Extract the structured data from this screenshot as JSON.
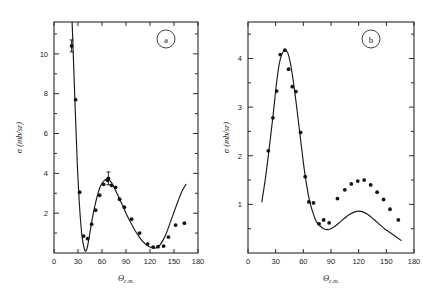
{
  "figure": {
    "background": "#ffffff",
    "curve_color": "#1a1a1a",
    "point_color": "#141414",
    "axis_color": "#2b2b2b"
  },
  "chart_data": [
    {
      "type": "scatter",
      "panel_label": "a",
      "title": "",
      "xlabel": "Θ",
      "xlabel_sub": "c.m.",
      "ylabel": "σ",
      "ylabel_unit": "(mb/sr)",
      "xlim": [
        0,
        180
      ],
      "ylim": [
        0,
        11.6
      ],
      "xticks": [
        0,
        30,
        60,
        90,
        120,
        150,
        180
      ],
      "xtick_labels": [
        "0",
        "30",
        "60",
        "90",
        "120",
        "150",
        "180"
      ],
      "yticks": [
        2,
        4,
        6,
        8,
        10
      ],
      "ytick_labels": [
        "2",
        "4",
        "6",
        "8",
        "10"
      ],
      "minor_yticks": [
        1,
        3,
        5,
        7,
        9,
        11
      ],
      "grid": false,
      "legend": false,
      "series": [
        {
          "name": "measured cross section",
          "kind": "points",
          "x": [
            22,
            27,
            32,
            37,
            42,
            47,
            52,
            57,
            62,
            67,
            68,
            72,
            77,
            82,
            88,
            97,
            107,
            117,
            124,
            130,
            137,
            143,
            152,
            163
          ],
          "y": [
            10.4,
            7.7,
            3.05,
            0.85,
            0.72,
            1.45,
            2.15,
            2.9,
            3.45,
            3.65,
            3.75,
            3.4,
            3.3,
            2.7,
            2.3,
            1.7,
            1.0,
            0.45,
            0.3,
            0.32,
            0.35,
            0.8,
            1.4,
            1.5
          ],
          "yerr": [
            0.3,
            0.0,
            0.0,
            0.0,
            0.0,
            0.0,
            0.0,
            0.0,
            0.0,
            0.0,
            0.32,
            0.0,
            0.0,
            0.0,
            0.0,
            0.0,
            0.0,
            0.0,
            0.0,
            0.0,
            0.0,
            0.0,
            0.0,
            0.0
          ]
        },
        {
          "name": "theoretical fit",
          "kind": "line",
          "x": [
            20,
            23,
            26,
            29,
            32,
            35,
            38,
            40,
            42,
            45,
            48,
            51,
            54,
            57,
            60,
            63,
            66,
            69,
            72,
            75,
            78,
            81,
            85,
            90,
            95,
            100,
            105,
            110,
            115,
            120,
            125,
            128,
            132,
            136,
            140,
            145,
            150,
            155,
            160,
            165
          ],
          "y": [
            14.2,
            11.2,
            7.8,
            4.6,
            2.3,
            0.85,
            0.2,
            0.1,
            0.35,
            1.05,
            1.75,
            2.35,
            2.85,
            3.25,
            3.5,
            3.65,
            3.72,
            3.68,
            3.52,
            3.3,
            3.05,
            2.8,
            2.45,
            2.0,
            1.6,
            1.22,
            0.9,
            0.62,
            0.42,
            0.3,
            0.25,
            0.26,
            0.38,
            0.62,
            0.95,
            1.5,
            2.05,
            2.6,
            3.1,
            3.45
          ]
        }
      ]
    },
    {
      "type": "scatter",
      "panel_label": "b",
      "title": "",
      "xlabel": "Θ",
      "xlabel_sub": "c.m.",
      "ylabel": "σ",
      "ylabel_unit": "(mb/sr)",
      "xlim": [
        0,
        180
      ],
      "ylim": [
        0,
        4.75
      ],
      "xticks": [
        0,
        30,
        60,
        90,
        120,
        150,
        180
      ],
      "xtick_labels": [
        "0",
        "30",
        "60",
        "90",
        "120",
        "150",
        "180"
      ],
      "yticks": [
        1,
        2,
        3,
        4
      ],
      "ytick_labels": [
        "1",
        "2",
        "3",
        "4"
      ],
      "minor_yticks": [
        0.5,
        1.5,
        2.5,
        3.5,
        4.5
      ],
      "grid": false,
      "legend": false,
      "series": [
        {
          "name": "measured cross section",
          "kind": "points",
          "x": [
            22,
            27,
            31,
            35,
            40,
            44,
            48,
            52,
            57,
            62,
            66,
            71,
            77,
            82,
            88,
            97,
            105,
            112,
            119,
            126,
            133,
            140,
            147,
            154,
            163
          ],
          "y": [
            2.1,
            2.78,
            3.33,
            4.08,
            4.17,
            3.78,
            3.42,
            3.32,
            2.48,
            1.57,
            1.05,
            1.03,
            0.6,
            0.68,
            0.62,
            1.12,
            1.3,
            1.42,
            1.48,
            1.5,
            1.4,
            1.25,
            1.1,
            0.9,
            0.68
          ],
          "yerr": [
            0,
            0,
            0,
            0,
            0,
            0,
            0,
            0,
            0,
            0,
            0,
            0,
            0,
            0,
            0,
            0,
            0,
            0,
            0,
            0,
            0,
            0,
            0,
            0,
            0
          ]
        },
        {
          "name": "theoretical fit",
          "kind": "line",
          "x": [
            15,
            19,
            23,
            27,
            31,
            34,
            37,
            40,
            43,
            46,
            49,
            52,
            55,
            58,
            61,
            64,
            67,
            70,
            74,
            78,
            82,
            86,
            90,
            95,
            100,
            105,
            110,
            115,
            120,
            125,
            130,
            136,
            142,
            148,
            154,
            160,
            166
          ],
          "y": [
            1.05,
            1.55,
            2.15,
            2.8,
            3.5,
            3.9,
            4.1,
            4.18,
            4.12,
            3.9,
            3.55,
            3.12,
            2.65,
            2.18,
            1.72,
            1.35,
            1.05,
            0.85,
            0.65,
            0.56,
            0.5,
            0.48,
            0.5,
            0.56,
            0.64,
            0.72,
            0.79,
            0.84,
            0.86,
            0.84,
            0.79,
            0.7,
            0.6,
            0.5,
            0.42,
            0.34,
            0.26
          ]
        }
      ]
    }
  ]
}
